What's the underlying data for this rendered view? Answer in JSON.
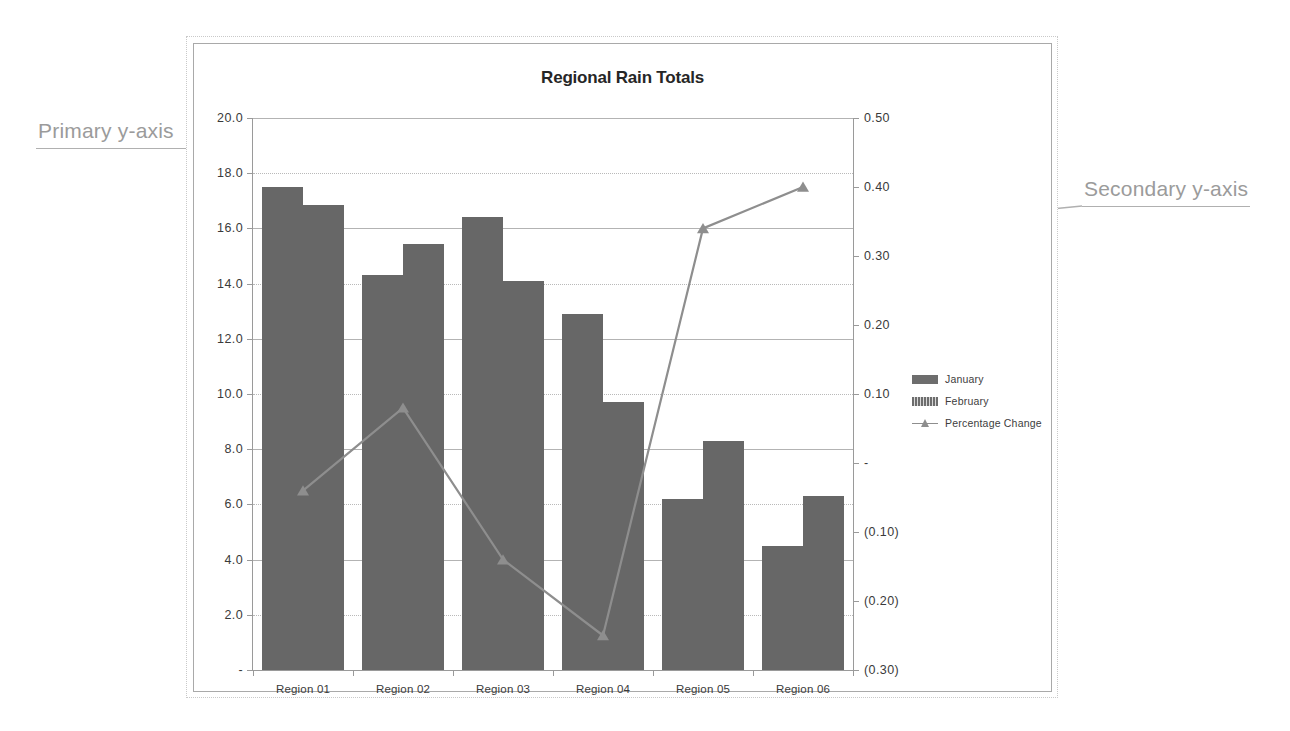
{
  "chart_data": {
    "type": "bar",
    "title": "Regional Rain Totals",
    "xlabel": "",
    "ylabel": "",
    "categories": [
      "Region 01",
      "Region 02",
      "Region 03",
      "Region 04",
      "Region 05",
      "Region 06"
    ],
    "series": [
      {
        "name": "January",
        "axis": "primary",
        "type": "bar",
        "values": [
          17.5,
          14.3,
          16.4,
          12.9,
          6.2,
          4.5
        ]
      },
      {
        "name": "February",
        "axis": "primary",
        "type": "bar",
        "values": [
          16.85,
          15.45,
          14.1,
          9.7,
          8.3,
          6.3
        ]
      },
      {
        "name": "Percentage Change",
        "axis": "secondary",
        "type": "line",
        "values": [
          -0.04,
          0.08,
          -0.14,
          -0.25,
          0.34,
          0.4
        ]
      }
    ],
    "primary_axis": {
      "ylim": [
        0,
        20
      ],
      "tick_values": [
        20,
        18,
        16,
        14,
        12,
        10,
        8,
        6,
        4,
        2,
        0
      ],
      "tick_labels": [
        "20.0",
        "18.0",
        "16.0",
        "14.0",
        "12.0",
        "10.0",
        "8.0",
        "6.0",
        "4.0",
        "2.0",
        "-"
      ]
    },
    "secondary_axis": {
      "ylim": [
        -0.3,
        0.5
      ],
      "tick_values": [
        0.5,
        0.4,
        0.3,
        0.2,
        0.1,
        0.0,
        -0.1,
        -0.2,
        -0.3
      ],
      "tick_labels": [
        "0.50",
        "0.40",
        "0.30",
        "0.20",
        "0.10",
        "-",
        "(0.10)",
        "(0.20)",
        "(0.30)"
      ]
    },
    "grid": true,
    "legend_position": "right",
    "colors": {
      "bar": "#676767",
      "line": "#8e8e8e",
      "grid": "#b3b3b3",
      "axis": "#9a9a9a",
      "text": "#3a3a3a",
      "annotation": "#9b9b9b"
    }
  },
  "legend": {
    "items": [
      {
        "label": "January",
        "marker": "bar-swatch"
      },
      {
        "label": "February",
        "marker": "bar-swatch-hatched"
      },
      {
        "label": "Percentage Change",
        "marker": "line-triangle-marker"
      }
    ]
  },
  "annotations": [
    {
      "id": "primary",
      "text": "Primary y-axis"
    },
    {
      "id": "secondary",
      "text": "Secondary y-axis"
    }
  ]
}
